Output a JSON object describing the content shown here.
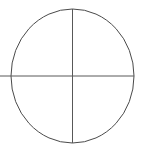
{
  "figure": {
    "title": "Circle with crosshair",
    "canvas": {
      "width": 146,
      "height": 150,
      "background_color": "#ffffff"
    },
    "shapes": [
      {
        "name": "outline-circle",
        "type": "ellipse",
        "center_x": 72.5,
        "center_y": 76,
        "radius_x": 61.5,
        "radius_y": 67,
        "stroke_color": "#4a4a4a",
        "stroke_width": 1,
        "fill": "none"
      },
      {
        "name": "vertical-crosshair-line",
        "type": "line",
        "x1": 72.5,
        "y1": 9,
        "x2": 72.5,
        "y2": 143,
        "stroke_color": "#585858",
        "stroke_width": 1
      },
      {
        "name": "horizontal-crosshair-line",
        "type": "line",
        "x1": 0,
        "y1": 76,
        "x2": 134,
        "y2": 76,
        "stroke_color": "#585858",
        "stroke_width": 1
      }
    ],
    "palette": {
      "background": "#ffffff",
      "circle_stroke": "#4a4a4a",
      "crosshair_stroke": "#585858"
    }
  }
}
